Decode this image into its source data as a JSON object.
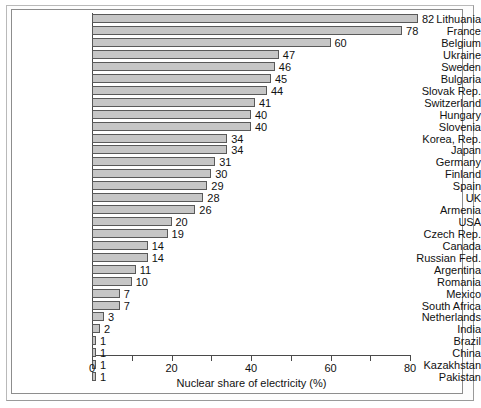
{
  "chart_data": {
    "type": "bar",
    "orientation": "horizontal",
    "title": "",
    "subtitle": "",
    "xlabel": "Nuclear share of electricity (%)",
    "ylabel": "",
    "xlim": [
      0,
      85
    ],
    "xticks": [
      0,
      10,
      20,
      30,
      40,
      50,
      60,
      70,
      80
    ],
    "xticklabels": [
      "0",
      "",
      "20",
      "",
      "40",
      "",
      "60",
      "",
      "80"
    ],
    "grid": false,
    "legend": false,
    "value_labels": true,
    "categories": [
      "Lithuania",
      "France",
      "Belgium",
      "Ukraine",
      "Sweden",
      "Bulgaria",
      "Slovak Rep.",
      "Switzerland",
      "Hungary",
      "Slovenia",
      "Korea, Rep.",
      "Japan",
      "Germany",
      "Finland",
      "Spain",
      "UK",
      "Armenia",
      "USA",
      "Czech Rep.",
      "Canada",
      "Russian Fed.",
      "Argentina",
      "Romania",
      "Mexico",
      "South Africa",
      "Netherlands",
      "India",
      "Brazil",
      "China",
      "Kazakhstan",
      "Pakistan"
    ],
    "values": [
      82,
      78,
      60,
      47,
      46,
      45,
      44,
      41,
      40,
      40,
      34,
      34,
      31,
      30,
      29,
      28,
      26,
      20,
      19,
      14,
      14,
      11,
      10,
      7,
      7,
      3,
      2,
      1,
      1,
      1,
      1
    ],
    "bar_color": "#c6c6c6",
    "bar_edge_color": "#595959",
    "background_color": "#ffffff"
  }
}
